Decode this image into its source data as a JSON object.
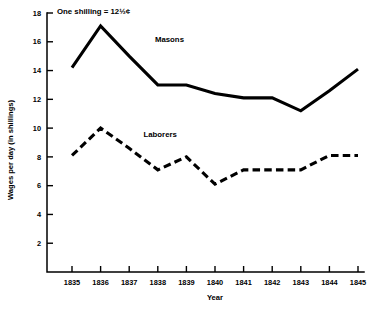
{
  "chart_data": {
    "type": "line",
    "title": "",
    "subtitle": "",
    "annotation": "One shilling = 12½¢",
    "xlabel": "Year",
    "ylabel": "Wages per day (in shillings)",
    "grid": false,
    "legend_position": "inline-series-labels",
    "x": [
      1835,
      1836,
      1837,
      1838,
      1839,
      1840,
      1841,
      1842,
      1843,
      1844,
      1845
    ],
    "xtick_labels": [
      "1835",
      "1836",
      "1837",
      "1838",
      "1839",
      "1840",
      "1841",
      "1842",
      "1843",
      "1844",
      "1845"
    ],
    "xlim": [
      1835,
      1845
    ],
    "ylim": [
      0,
      18
    ],
    "ytick_labels": [
      "2",
      "4",
      "6",
      "8",
      "10",
      "12",
      "14",
      "16",
      "18"
    ],
    "yticks": [
      2,
      4,
      6,
      8,
      10,
      12,
      14,
      16,
      18
    ],
    "series": [
      {
        "name": "Masons",
        "style": "solid",
        "color": "#000000",
        "label_x": 1837.9,
        "label_y": 16.0,
        "values": [
          14.2,
          17.1,
          15.0,
          13.0,
          13.0,
          12.4,
          12.1,
          12.1,
          11.2,
          12.6,
          14.1
        ]
      },
      {
        "name": "Laborers",
        "style": "dashed",
        "color": "#000000",
        "label_x": 1837.5,
        "label_y": 9.4,
        "values": [
          8.1,
          10.0,
          8.6,
          7.1,
          8.0,
          6.1,
          7.1,
          7.1,
          7.1,
          8.1,
          8.1
        ]
      }
    ]
  }
}
